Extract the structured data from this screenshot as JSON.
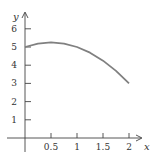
{
  "chart_data": {
    "type": "line",
    "title": "",
    "xlabel": "x",
    "ylabel": "y",
    "xlim": [
      0,
      2.2
    ],
    "ylim": [
      0,
      6.5
    ],
    "grid": false,
    "legend": null,
    "x_ticks": [
      0.5,
      1,
      1.5,
      2
    ],
    "x_tick_labels": [
      "0.5",
      "1",
      "1.5",
      "2"
    ],
    "y_ticks": [
      1,
      2,
      3,
      4,
      5,
      6
    ],
    "y_tick_labels": [
      "1",
      "2",
      "3",
      "4",
      "5",
      "6"
    ],
    "series": [
      {
        "name": "y = 5 + x - x^2",
        "x": [
          0,
          0.25,
          0.5,
          0.75,
          1,
          1.25,
          1.5,
          1.75,
          2
        ],
        "values": [
          5,
          5.1875,
          5.25,
          5.1875,
          5,
          4.6875,
          4.25,
          3.6875,
          3
        ],
        "color": "#808080"
      }
    ]
  },
  "colors": {
    "axis": "#444444",
    "curve": "#808080",
    "text": "#333333"
  }
}
